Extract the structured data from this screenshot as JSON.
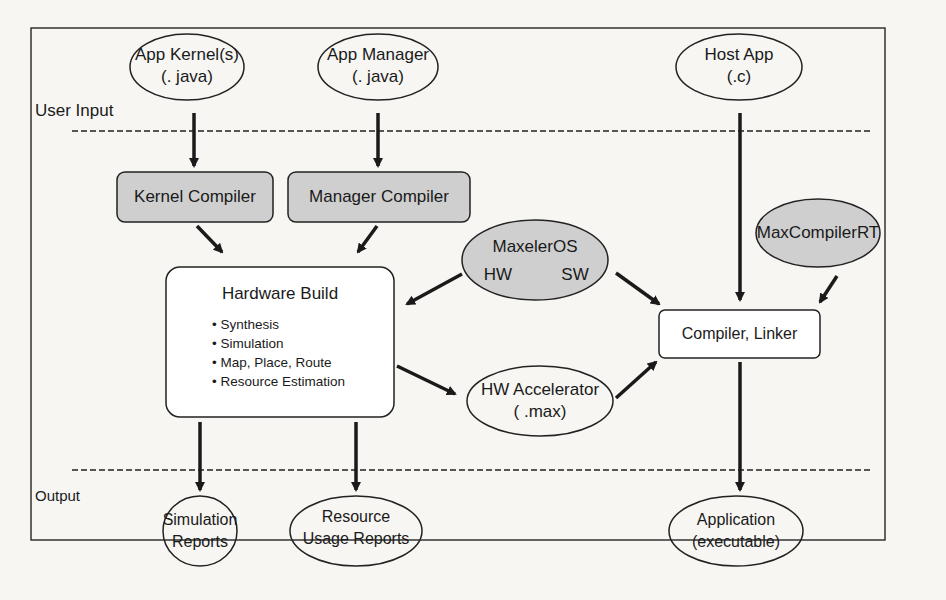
{
  "diagram": {
    "zones": {
      "input": "User Input",
      "output": "Output"
    },
    "nodes": {
      "app_kernel": {
        "line1": "App Kernel(s)",
        "line2": "(. java)"
      },
      "app_manager": {
        "line1": "App Manager",
        "line2": "(. java)"
      },
      "host_app": {
        "line1": "Host App",
        "line2": "(.c)"
      },
      "kernel_compiler": {
        "label": "Kernel Compiler"
      },
      "manager_compiler": {
        "label": "Manager Compiler"
      },
      "maxeleros": {
        "label": "MaxelerOS",
        "hw": "HW",
        "sw": "SW"
      },
      "maxcompilerrt": {
        "label": "MaxCompilerRT"
      },
      "hardware_build": {
        "title": "Hardware Build",
        "steps": [
          "Synthesis",
          "Simulation",
          "Map, Place, Route",
          "Resource Estimation"
        ]
      },
      "compiler_linker": {
        "label": "Compiler, Linker"
      },
      "hw_accelerator": {
        "line1": "HW Accelerator",
        "line2": "( .max)"
      },
      "simulation_reports": {
        "line1": "Simulation",
        "line2": "Reports"
      },
      "resource_reports": {
        "line1": "Resource",
        "line2": "Usage Reports"
      },
      "application": {
        "line1": "Application",
        "line2": "(executable)"
      }
    },
    "colors": {
      "shaded": "#cfcfcf",
      "stroke": "#1a1a1a",
      "background": "#f7f6f3"
    }
  }
}
